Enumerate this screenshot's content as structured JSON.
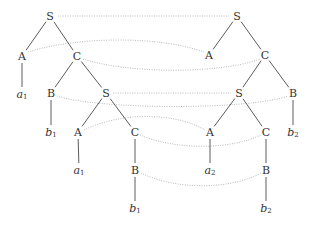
{
  "diagram": {
    "colors": {
      "edge": "#4a4a4a",
      "link": "#a8a8a8",
      "text": "#333333"
    },
    "left_tree": {
      "nodes": [
        {
          "id": "L_S1",
          "label": "S",
          "x": 50,
          "y": 16
        },
        {
          "id": "L_A1",
          "label": "A",
          "x": 22,
          "y": 56
        },
        {
          "id": "L_C1",
          "label": "C",
          "x": 77,
          "y": 56
        },
        {
          "id": "L_a1",
          "label": "a",
          "sub": "1",
          "leaf": true,
          "x": 22,
          "y": 94
        },
        {
          "id": "L_B1",
          "label": "B",
          "x": 51,
          "y": 93
        },
        {
          "id": "L_S2",
          "label": "S",
          "x": 106,
          "y": 93
        },
        {
          "id": "L_b1",
          "label": "b",
          "sub": "1",
          "leaf": true,
          "x": 51,
          "y": 132
        },
        {
          "id": "L_A2",
          "label": "A",
          "x": 78,
          "y": 132
        },
        {
          "id": "L_C2",
          "label": "C",
          "x": 135,
          "y": 132
        },
        {
          "id": "L_a1b",
          "label": "a",
          "sub": "1",
          "leaf": true,
          "x": 79,
          "y": 170
        },
        {
          "id": "L_B2",
          "label": "B",
          "x": 135,
          "y": 170
        },
        {
          "id": "L_b1b",
          "label": "b",
          "sub": "1",
          "leaf": true,
          "x": 135,
          "y": 208
        }
      ],
      "edges": [
        [
          "L_S1",
          "L_A1"
        ],
        [
          "L_S1",
          "L_C1"
        ],
        [
          "L_A1",
          "L_a1"
        ],
        [
          "L_C1",
          "L_B1"
        ],
        [
          "L_C1",
          "L_S2"
        ],
        [
          "L_B1",
          "L_b1"
        ],
        [
          "L_S2",
          "L_A2"
        ],
        [
          "L_S2",
          "L_C2"
        ],
        [
          "L_A2",
          "L_a1b"
        ],
        [
          "L_C2",
          "L_B2"
        ],
        [
          "L_B2",
          "L_b1b"
        ]
      ]
    },
    "right_tree": {
      "nodes": [
        {
          "id": "R_S1",
          "label": "S",
          "x": 237,
          "y": 16
        },
        {
          "id": "R_A1",
          "label": "A",
          "x": 209,
          "y": 55
        },
        {
          "id": "R_C1",
          "label": "C",
          "x": 265,
          "y": 55
        },
        {
          "id": "R_S2",
          "label": "S",
          "x": 239,
          "y": 93
        },
        {
          "id": "R_B1",
          "label": "B",
          "x": 293,
          "y": 93
        },
        {
          "id": "R_A2",
          "label": "A",
          "x": 210,
          "y": 132
        },
        {
          "id": "R_C2",
          "label": "C",
          "x": 266,
          "y": 132
        },
        {
          "id": "R_b2",
          "label": "b",
          "sub": "2",
          "leaf": true,
          "x": 293,
          "y": 132
        },
        {
          "id": "R_a2",
          "label": "a",
          "sub": "2",
          "leaf": true,
          "x": 210,
          "y": 170
        },
        {
          "id": "R_B2",
          "label": "B",
          "x": 266,
          "y": 170
        },
        {
          "id": "R_b2b",
          "label": "b",
          "sub": "2",
          "leaf": true,
          "x": 266,
          "y": 208
        }
      ],
      "edges": [
        [
          "R_S1",
          "R_A1"
        ],
        [
          "R_S1",
          "R_C1"
        ],
        [
          "R_C1",
          "R_S2"
        ],
        [
          "R_C1",
          "R_B1"
        ],
        [
          "R_S2",
          "R_A2"
        ],
        [
          "R_S2",
          "R_C2"
        ],
        [
          "R_B1",
          "R_b2"
        ],
        [
          "R_A2",
          "R_a2"
        ],
        [
          "R_C2",
          "R_B2"
        ],
        [
          "R_B2",
          "R_b2b"
        ]
      ]
    },
    "links": [
      {
        "from": "L_S1",
        "to": "R_S1",
        "path": "M58 16 L229 16"
      },
      {
        "from": "L_A1",
        "to": "R_A1",
        "path": "M28 52 C 80 36, 160 36, 204 52"
      },
      {
        "from": "L_C1",
        "to": "R_C1",
        "path": "M83 59 C 130 74, 220 74, 260 59"
      },
      {
        "from": "L_S2",
        "to": "R_S2",
        "path": "M113 93 L231 93"
      },
      {
        "from": "L_B1",
        "to": "R_B1",
        "path": "M57 96 C 100 110, 250 110, 288 96"
      },
      {
        "from": "L_A2",
        "to": "R_A2",
        "path": "M84 130 C 120 112, 175 112, 205 130"
      },
      {
        "from": "L_C2",
        "to": "R_C2",
        "path": "M140 135 C 175 150, 230 150, 261 135"
      },
      {
        "from": "L_B2",
        "to": "R_B2",
        "path": "M141 173 C 175 190, 230 190, 261 173"
      }
    ]
  }
}
